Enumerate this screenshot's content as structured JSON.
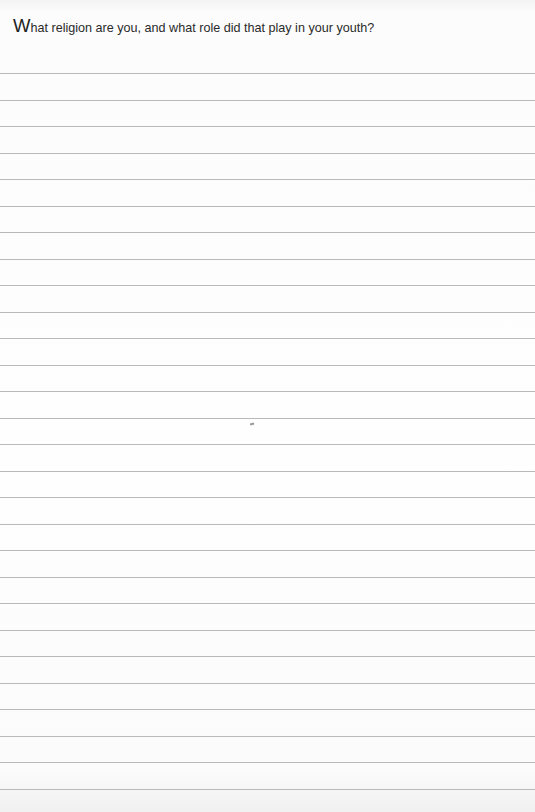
{
  "worksheet": {
    "prompt": {
      "initial": "W",
      "rest": "hat religion are you, and what role did that play in your youth?"
    },
    "answer_lines": {
      "count": 28,
      "content": []
    }
  }
}
